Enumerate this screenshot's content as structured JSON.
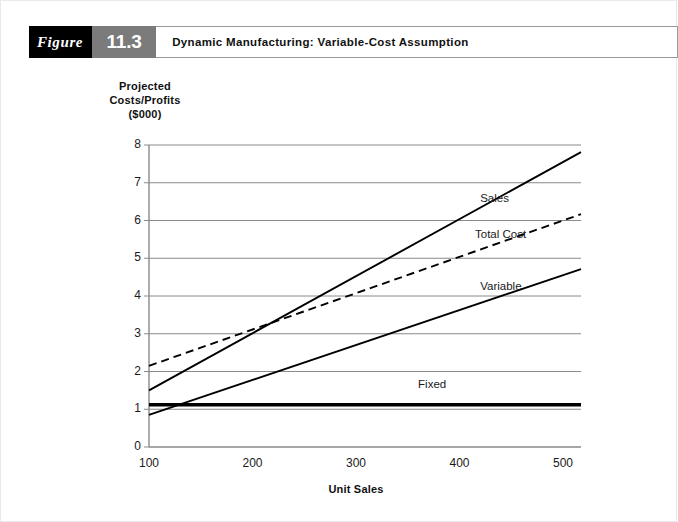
{
  "figure": {
    "word": "Figure",
    "number": "11.3",
    "title": "Dynamic Manufacturing: Variable-Cost Assumption"
  },
  "chart_data": {
    "type": "line",
    "title": "Dynamic Manufacturing: Variable-Cost Assumption",
    "xlabel": "Unit Sales",
    "ylabel": "Projected Costs/Profits ($000)",
    "ylabel_lines": [
      "Projected",
      "Costs/Profits",
      "($000)"
    ],
    "xlim": [
      100,
      500
    ],
    "ylim": [
      0,
      8
    ],
    "x_ticks": [
      100,
      200,
      300,
      400,
      500
    ],
    "y_ticks": [
      0,
      1,
      2,
      3,
      4,
      5,
      6,
      7,
      8
    ],
    "grid": "horizontal",
    "legend": "inline-right",
    "x": [
      100,
      500
    ],
    "series": [
      {
        "name": "Sales",
        "values": [
          1.5,
          7.55
        ],
        "style": "solid",
        "width": "normal",
        "color": "#000000",
        "label_x": 420,
        "label_y": 6.55
      },
      {
        "name": "Total Cost",
        "values": [
          2.15,
          6.0
        ],
        "style": "dashed",
        "width": "normal",
        "color": "#000000",
        "label_x": 415,
        "label_y": 5.6
      },
      {
        "name": "Variable",
        "values": [
          0.85,
          4.55
        ],
        "style": "solid",
        "width": "normal",
        "color": "#000000",
        "label_x": 420,
        "label_y": 4.2
      },
      {
        "name": "Fixed",
        "values": [
          1.12,
          1.12
        ],
        "style": "solid",
        "width": "thick",
        "color": "#000000",
        "label_x": 360,
        "label_y": 1.62
      }
    ],
    "annotations": [
      {
        "text": "Sales crosses Total Cost near 210 units at about 3.0"
      }
    ],
    "colors": {
      "gridline": "#8a8a8a",
      "axis": "#8a8a8a",
      "series": "#000000",
      "background": "#ffffff"
    }
  }
}
